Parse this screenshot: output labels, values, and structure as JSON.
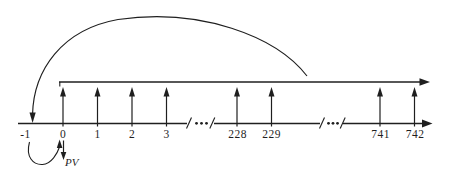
{
  "diagram": {
    "type": "cash-flow-timeline",
    "timeline": {
      "ticks": [
        "-1",
        "0",
        "1",
        "2",
        "3",
        "228",
        "229",
        "741",
        "742"
      ],
      "break_mark_slash": "/",
      "break_mark_dots": "· · ·"
    },
    "labels": {
      "present_value": "PV"
    },
    "icons": {
      "axis_right_arrow": "→",
      "cash_flow_up_arrow": "↑",
      "accumulation_arc_down_arrow": "↓",
      "pv_down_arrow": "↓"
    },
    "colors": {
      "ink": "#1f1f1f",
      "background": "#ffffff"
    }
  }
}
